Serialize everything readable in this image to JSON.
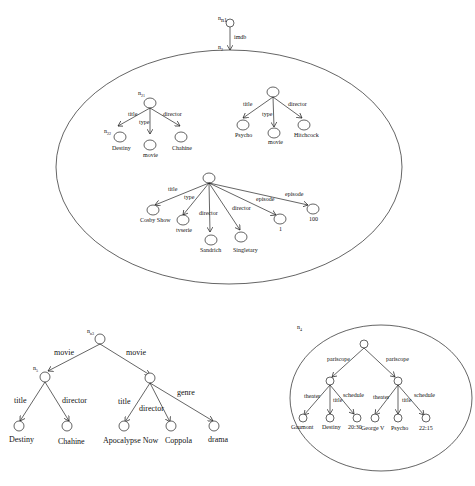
{
  "figure": {
    "top_graph": {
      "root": {
        "label": "n1",
        "edge_to_n2": "imdb"
      },
      "container_label": "n2",
      "subtrees": [
        {
          "root_label": "n21",
          "edges": [
            {
              "label": "title",
              "target": "Destiny",
              "target_node_label": "n22"
            },
            {
              "label": "type",
              "target": "movie"
            },
            {
              "label": "director",
              "target": "Chahine"
            }
          ]
        },
        {
          "root_label": "",
          "edges": [
            {
              "label": "title",
              "target": "Psycho"
            },
            {
              "label": "type",
              "target": "movie"
            },
            {
              "label": "director",
              "target": "Hitchcock"
            }
          ]
        },
        {
          "root_label": "",
          "edges": [
            {
              "label": "title",
              "target": "Cosby Show"
            },
            {
              "label": "type",
              "target": "tvserie"
            },
            {
              "label": "director",
              "target": "Sandrich"
            },
            {
              "label": "director",
              "target": "Singletary"
            },
            {
              "label": "episode",
              "target": "1"
            },
            {
              "label": "episode",
              "target": "100"
            }
          ]
        }
      ]
    },
    "bottom_left_tree": {
      "root_label": "n3",
      "child_label": "n5",
      "edges": [
        {
          "label": "movie",
          "children": [
            {
              "label": "title",
              "target": "Destiny"
            },
            {
              "label": "director",
              "target": "Chahine"
            }
          ]
        },
        {
          "label": "movie",
          "children": [
            {
              "label": "title",
              "target": "Apocalypse Now"
            },
            {
              "label": "director",
              "target": "Coppola"
            },
            {
              "label": "genre",
              "target": "drama"
            }
          ]
        }
      ]
    },
    "bottom_right_graph": {
      "container_label": "n4",
      "edges": [
        {
          "label": "pariscope",
          "children": [
            {
              "label": "theater",
              "target": "Gaumont"
            },
            {
              "label": "title",
              "target": "Destiny"
            },
            {
              "label": "schedule",
              "target": "20:30"
            }
          ]
        },
        {
          "label": "pariscope",
          "children": [
            {
              "label": "theater",
              "target": "George V"
            },
            {
              "label": "title",
              "target": "Psycho"
            },
            {
              "label": "schedule",
              "target": "22:15"
            }
          ]
        }
      ]
    }
  }
}
